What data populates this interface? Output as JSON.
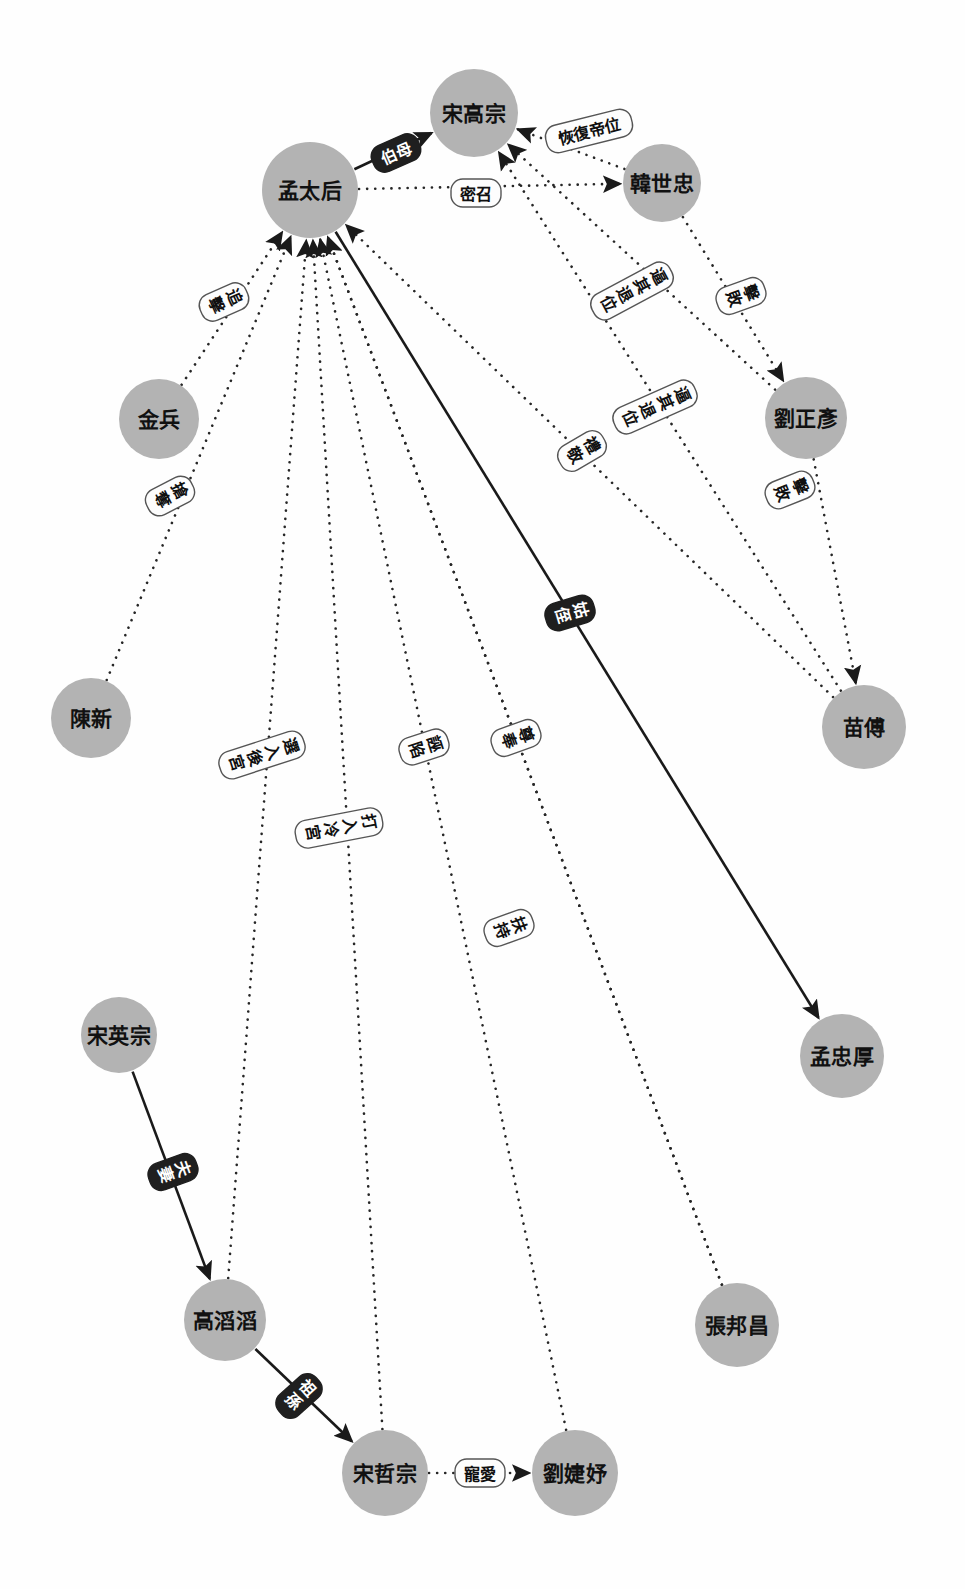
{
  "diagram": {
    "type": "directed-graph",
    "title": "",
    "canvas": {
      "width": 965,
      "height": 1589,
      "background": "#fefefe"
    },
    "style": {
      "node_fill": "#b3b3b3",
      "node_text": "#111111",
      "edge_dotted_color": "#262626",
      "edge_solid_color": "#1a1a1a",
      "label_light_fill": "#fdfdfd",
      "label_light_text": "#101010",
      "label_dark_fill": "#1f1f1f",
      "label_dark_text": "#ffffff"
    },
    "nodes": [
      {
        "id": "menghou",
        "label": "孟太后",
        "x": 310,
        "y": 190,
        "r": 48
      },
      {
        "id": "gaozong",
        "label": "宋高宗",
        "x": 474,
        "y": 113,
        "r": 44
      },
      {
        "id": "hanshi",
        "label": "韓世忠",
        "x": 662,
        "y": 183,
        "r": 39
      },
      {
        "id": "liuzheng",
        "label": "劉正彥",
        "x": 806,
        "y": 418,
        "r": 41
      },
      {
        "id": "miaofu",
        "label": "苗傅",
        "x": 864,
        "y": 727,
        "r": 42
      },
      {
        "id": "jinbing",
        "label": "金兵",
        "x": 159,
        "y": 419,
        "r": 40
      },
      {
        "id": "chenxin",
        "label": "陳新",
        "x": 91,
        "y": 718,
        "r": 40
      },
      {
        "id": "mengzhong",
        "label": "孟忠厚",
        "x": 842,
        "y": 1056,
        "r": 42
      },
      {
        "id": "songying",
        "label": "宋英宗",
        "x": 119,
        "y": 1035,
        "r": 38
      },
      {
        "id": "gaotaotao",
        "label": "高滔滔",
        "x": 225,
        "y": 1320,
        "r": 41
      },
      {
        "id": "zhangbang",
        "label": "張邦昌",
        "x": 737,
        "y": 1325,
        "r": 42
      },
      {
        "id": "songzhe",
        "label": "宋哲宗",
        "x": 385,
        "y": 1473,
        "r": 43
      },
      {
        "id": "liujieyu",
        "label": "劉婕妤",
        "x": 575,
        "y": 1473,
        "r": 43
      }
    ],
    "edges": [
      {
        "id": "e1",
        "from": "menghou",
        "to": "gaozong",
        "label": "伯母",
        "style": "solid",
        "label_style": "dark",
        "lx": 396,
        "ly": 153,
        "rot": -24,
        "vertical": false
      },
      {
        "id": "e2",
        "from": "menghou",
        "to": "hanshi",
        "label": "密召",
        "style": "dotted",
        "label_style": "light",
        "lx": 476,
        "ly": 193,
        "rot": 0,
        "vertical": false
      },
      {
        "id": "e3",
        "from": "hanshi",
        "to": "gaozong",
        "label": "恢復帝位",
        "style": "dotted",
        "label_style": "light",
        "lx": 589,
        "ly": 131,
        "rot": -14,
        "vertical": false
      },
      {
        "id": "e4",
        "from": "hanshi",
        "to": "liuzheng",
        "label": "擊敗",
        "style": "dotted",
        "label_style": "light",
        "lx": 741,
        "ly": 296,
        "rot": 70,
        "vertical": true
      },
      {
        "id": "e5",
        "from": "liuzheng",
        "to": "miaofu",
        "label": "擊敗",
        "style": "dotted",
        "label_style": "light",
        "lx": 790,
        "ly": 490,
        "rot": 68,
        "vertical": true
      },
      {
        "id": "e6",
        "from": "miaofu",
        "to": "gaozong",
        "label": "逼其退位",
        "style": "dotted",
        "label_style": "light",
        "lx": 655,
        "ly": 407,
        "rot": 66,
        "vertical": true
      },
      {
        "id": "e7",
        "from": "liuzheng",
        "to": "gaozong",
        "label": "逼其退位",
        "style": "dotted",
        "label_style": "light",
        "lx": 632,
        "ly": 291,
        "rot": 62,
        "vertical": true
      },
      {
        "id": "e8",
        "from": "miaofu",
        "to": "menghou",
        "label": "禮敬",
        "style": "dotted",
        "label_style": "light",
        "lx": 582,
        "ly": 451,
        "rot": 60,
        "vertical": true
      },
      {
        "id": "e9",
        "from": "jinbing",
        "to": "menghou",
        "label": "追擊",
        "style": "dotted",
        "label_style": "light",
        "lx": 224,
        "ly": 302,
        "rot": 66,
        "vertical": true
      },
      {
        "id": "e10",
        "from": "chenxin",
        "to": "menghou",
        "label": "搶奪",
        "style": "dotted",
        "label_style": "light",
        "lx": 170,
        "ly": 496,
        "rot": 63,
        "vertical": true
      },
      {
        "id": "e11",
        "from": "gaotaotao",
        "to": "menghou",
        "label": "選入後宮",
        "style": "dotted",
        "label_style": "light",
        "lx": 262,
        "ly": 755,
        "rot": 72,
        "vertical": true
      },
      {
        "id": "e12",
        "from": "songzhe",
        "to": "menghou",
        "label": "打入冷宮",
        "style": "dotted",
        "label_style": "light",
        "lx": 339,
        "ly": 828,
        "rot": 79,
        "vertical": true
      },
      {
        "id": "e13",
        "from": "zhangbang",
        "to": "menghou",
        "label": "誣陷",
        "style": "dotted",
        "label_style": "light",
        "lx": 424,
        "ly": 747,
        "rot": 72,
        "vertical": true
      },
      {
        "id": "e14",
        "from": "zhangbang",
        "to": "menghou",
        "label": "尊奉",
        "style": "dotted",
        "label_style": "light",
        "lx": 516,
        "ly": 738,
        "rot": 70,
        "vertical": true
      },
      {
        "id": "e15",
        "from": "liujieyu",
        "to": "menghou",
        "label": "扶持",
        "style": "dotted",
        "label_style": "light",
        "lx": 509,
        "ly": 928,
        "rot": 70,
        "vertical": true
      },
      {
        "id": "e16",
        "from": "menghou",
        "to": "mengzhong",
        "label": "姑侄",
        "style": "solid",
        "label_style": "dark",
        "lx": 570,
        "ly": 613,
        "rot": 73,
        "vertical": true
      },
      {
        "id": "e17",
        "from": "songying",
        "to": "gaotaotao",
        "label": "夫妻",
        "style": "solid",
        "label_style": "dark",
        "lx": 173,
        "ly": 1172,
        "rot": 70,
        "vertical": true
      },
      {
        "id": "e18",
        "from": "gaotaotao",
        "to": "songzhe",
        "label": "祖孫",
        "style": "solid",
        "label_style": "dark",
        "lx": 299,
        "ly": 1396,
        "rot": 48,
        "vertical": true
      },
      {
        "id": "e19",
        "from": "songzhe",
        "to": "liujieyu",
        "label": "寵愛",
        "style": "dotted",
        "label_style": "light",
        "lx": 480,
        "ly": 1473,
        "rot": 0,
        "vertical": false
      }
    ]
  }
}
